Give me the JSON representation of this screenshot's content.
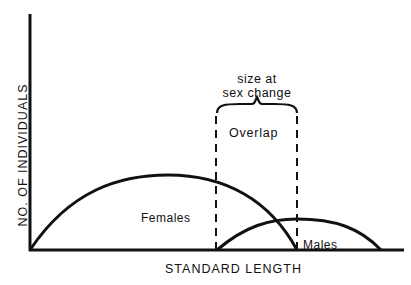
{
  "diagram": {
    "type": "frequency-distribution-schematic",
    "y_axis_label": "NO. OF INDIVIDUALS",
    "x_axis_label": "STANDARD LENGTH",
    "annotation": "size at\nsex change",
    "annotation_line1": "size at",
    "annotation_line2": "sex change",
    "overlap_label": "Overlap",
    "curves": [
      {
        "name": "Females",
        "label": "Females",
        "start": 30,
        "peak": 168,
        "end": 297,
        "relative_height": "high"
      },
      {
        "name": "Males",
        "label": "Males",
        "start": 217,
        "peak": 297,
        "end": 381,
        "relative_height": "low"
      }
    ],
    "overlap_region": {
      "left_bound": "start of male distribution",
      "right_bound": "end of female distribution"
    },
    "colors": {
      "line": "#111111",
      "background": "#ffffff"
    }
  }
}
